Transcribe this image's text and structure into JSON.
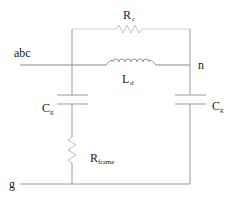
{
  "diagram": {
    "type": "circuit-schematic",
    "nodes": {
      "abc": "abc",
      "n": "n",
      "g": "g"
    },
    "components": [
      {
        "id": "Rc",
        "kind": "resistor",
        "label_main": "R",
        "label_sub": "c",
        "between": [
          "left-bus",
          "right-bus"
        ],
        "position": "top"
      },
      {
        "id": "Ld",
        "kind": "inductor",
        "label_main": "L",
        "label_sub": "d",
        "between": [
          "abc",
          "n"
        ],
        "position": "middle"
      },
      {
        "id": "Cg_left",
        "kind": "capacitor",
        "label_main": "C",
        "label_sub": "g",
        "between": [
          "abc",
          "Rframe"
        ]
      },
      {
        "id": "Cg_right",
        "kind": "capacitor",
        "label_main": "C",
        "label_sub": "g",
        "between": [
          "n",
          "g"
        ]
      },
      {
        "id": "Rframe",
        "kind": "resistor",
        "label_main": "R",
        "label_sub": "frame",
        "between": [
          "Cg_left",
          "g"
        ]
      }
    ],
    "colors": {
      "wire": "#888888",
      "wire_faint": "#cccccc",
      "text": "#222222"
    }
  }
}
